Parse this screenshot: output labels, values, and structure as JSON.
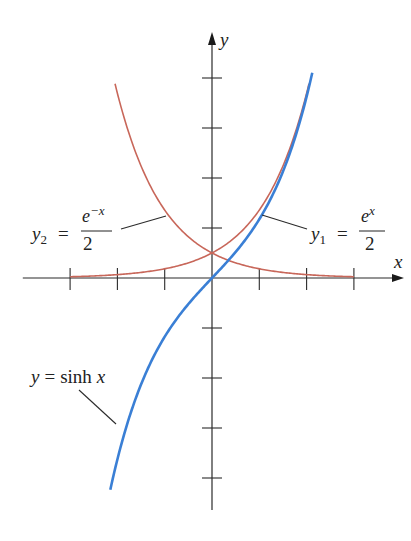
{
  "chart_data": {
    "type": "line",
    "title": "",
    "xlabel": "x",
    "ylabel": "y",
    "xlim": [
      -4,
      4
    ],
    "ylim": [
      -4.6,
      5
    ],
    "x_ticks": [
      -3,
      -2,
      -1,
      1,
      2,
      3
    ],
    "y_ticks": [
      -4,
      -3,
      -2,
      -1,
      1,
      2,
      3,
      4
    ],
    "tick_labels_shown": false,
    "grid": false,
    "legend": "none (inline labels)",
    "series": [
      {
        "name": "y1 = e^x / 2",
        "key": "y1",
        "function": "exp(x)/2",
        "x_range": [
          -3,
          2.05
        ],
        "color": "#c8675a",
        "sample_points": [
          [
            -3,
            0.025
          ],
          [
            -2,
            0.068
          ],
          [
            -1,
            0.184
          ],
          [
            0,
            0.5
          ],
          [
            1,
            1.359
          ],
          [
            2,
            3.695
          ]
        ]
      },
      {
        "name": "y2 = e^-x / 2",
        "key": "y2",
        "function": "exp(-x)/2",
        "x_range": [
          -2.05,
          3
        ],
        "color": "#c8675a",
        "sample_points": [
          [
            -2,
            3.695
          ],
          [
            -1,
            1.359
          ],
          [
            0,
            0.5
          ],
          [
            1,
            0.184
          ],
          [
            2,
            0.068
          ],
          [
            3,
            0.025
          ]
        ]
      },
      {
        "name": "y = sinh x",
        "key": "sinh",
        "function": "sinh(x)",
        "x_range": [
          -2.15,
          2.12
        ],
        "color": "#3a7fd5",
        "sample_points": [
          [
            -2,
            -3.627
          ],
          [
            -1,
            -1.175
          ],
          [
            0,
            0
          ],
          [
            1,
            1.175
          ],
          [
            2,
            3.627
          ]
        ]
      }
    ],
    "annotations": {
      "y1": {
        "lhs": "y",
        "sub": "1",
        "eq": "=",
        "num_base": "e",
        "num_exp": "x",
        "den": "2",
        "points_to_x": 1.1
      },
      "y2": {
        "lhs": "y",
        "sub": "2",
        "eq": "=",
        "num_base": "e",
        "num_exp": "−x",
        "den": "2",
        "points_to_x": -1.95
      },
      "sinh": {
        "lhs": "y",
        "eq": "=",
        "rhs_fn": "sinh",
        "rhs_var": "x",
        "points_to_x": -2.0
      }
    },
    "axis_labels": {
      "x": "x",
      "y": "y"
    }
  }
}
